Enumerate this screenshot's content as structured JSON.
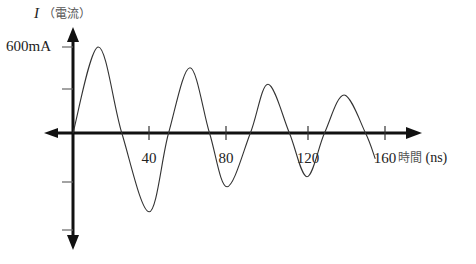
{
  "chart_data": {
    "type": "line",
    "title": "",
    "xlabel": "時間 (ns)",
    "ylabel": "I（電流）",
    "y_symbol": "I",
    "y_name": "電流",
    "x_name": "時間",
    "x_unit": "(ns)",
    "x_ticks": [
      40,
      80,
      120,
      160
    ],
    "y_tick_label": "600mA",
    "y_ticks_mA": [
      600,
      300,
      -300,
      -600
    ],
    "xlim": [
      0,
      170
    ],
    "ylim": [
      -650,
      680
    ],
    "grid": false,
    "legend": null,
    "series": [
      {
        "name": "current",
        "x": [
          0,
          13,
          25,
          39,
          49,
          60,
          70,
          79,
          91,
          100,
          111,
          120,
          129,
          139,
          150,
          155
        ],
        "y": [
          0,
          600,
          0,
          -550,
          0,
          455,
          0,
          -375,
          0,
          340,
          0,
          -305,
          0,
          265,
          0,
          -180
        ]
      }
    ]
  },
  "labels": {
    "y_symbol": "I",
    "y_name": "（電流）",
    "y_tick": "600mA",
    "x_ticks": [
      "40",
      "80",
      "120",
      "160"
    ],
    "x_name": "時間",
    "x_unit": "(ns)"
  }
}
